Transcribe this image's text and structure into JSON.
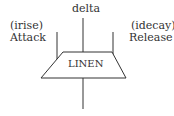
{
  "diagram": {
    "unit_generator": "LINEN",
    "inputs": {
      "top": "delta",
      "left": {
        "param": "(irise)",
        "name": "Attack"
      },
      "right": {
        "param": "(idecay)",
        "name": "Release"
      }
    },
    "stroke_color": "#333333"
  }
}
